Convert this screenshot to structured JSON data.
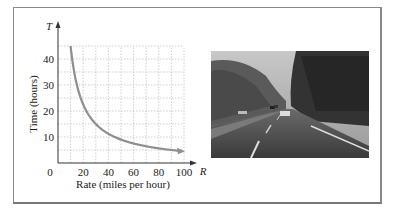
{
  "chart_data": {
    "type": "line",
    "title": "",
    "xlabel": "Rate (miles per hour)",
    "ylabel": "Time (hours)",
    "x_axis_symbol": "R",
    "y_axis_symbol": "T",
    "x_ticks": [
      "0",
      "20",
      "40",
      "60",
      "80",
      "100"
    ],
    "y_ticks": [
      "10",
      "20",
      "30",
      "40"
    ],
    "xlim": [
      0,
      100
    ],
    "ylim": [
      0,
      45
    ],
    "grid": true,
    "grid_x_step": 10,
    "grid_y_step": 5,
    "series": [
      {
        "name": "T = 450/R",
        "x": [
          10,
          15,
          20,
          25,
          30,
          40,
          50,
          60,
          70,
          80,
          90,
          100
        ],
        "y": [
          45,
          30,
          22.5,
          18,
          15,
          11.25,
          9,
          7.5,
          6.43,
          5.63,
          5,
          4.5
        ]
      }
    ],
    "curve_color": "#8f8f8f"
  },
  "photo": {
    "description": "Highway through wooded area with cars"
  }
}
